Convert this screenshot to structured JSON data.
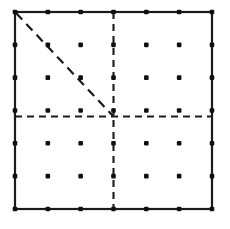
{
  "figure": {
    "canvas": {
      "width": 230,
      "height": 229,
      "background": "#ffffff"
    },
    "square": {
      "name": "outer-square",
      "x": 15,
      "y": 12,
      "size": 197,
      "stroke": "#1a1a1a",
      "stroke_width": 2.2,
      "style": "solid"
    },
    "lattice": {
      "name": "dot-lattice",
      "cells_per_side": 6,
      "points_per_side": 7,
      "spacing": 32.83,
      "origin_x": 15,
      "origin_y": 12,
      "dot_radius": 2.3,
      "dot_color": "#101010",
      "total_dots": 49
    },
    "bisectors": [
      {
        "name": "vertical-bisector",
        "orientation": "vertical",
        "x1": 113.5,
        "y1": 12,
        "x2": 113.5,
        "y2": 213,
        "style": "dashed",
        "dash": "7 5",
        "stroke": "#1a1a1a",
        "stroke_width": 2.1
      },
      {
        "name": "horizontal-bisector",
        "orientation": "horizontal",
        "x1": 15,
        "y1": 116.5,
        "x2": 212,
        "y2": 116.5,
        "style": "dashed",
        "dash": "7 5",
        "stroke": "#1a1a1a",
        "stroke_width": 2.1
      }
    ],
    "diagonal": {
      "name": "corner-to-center-diagonal",
      "from": "top-left-corner",
      "to": "center",
      "x1": 16,
      "y1": 13,
      "x2": 113.5,
      "y2": 116.5,
      "style": "dashed",
      "dash": "9 6",
      "stroke": "#1a1a1a",
      "stroke_width": 2.2
    },
    "quadrants": [
      {
        "name": "top-left-quadrant",
        "interior_dots": 9,
        "has_diagonal": true
      },
      {
        "name": "top-right-quadrant",
        "interior_dots": 9,
        "has_diagonal": false
      },
      {
        "name": "bottom-left-quadrant",
        "interior_dots": 9,
        "has_diagonal": false
      },
      {
        "name": "bottom-right-quadrant",
        "interior_dots": 9,
        "has_diagonal": false
      }
    ]
  },
  "chart_data": {
    "type": "scatter",
    "xlabel": "",
    "ylabel": "",
    "xlim": [
      0,
      6
    ],
    "ylim": [
      0,
      6
    ],
    "grid": false,
    "legend": null,
    "series": [
      {
        "name": "lattice-points",
        "marker": "dot",
        "x": [
          0,
          1,
          2,
          3,
          4,
          5,
          6,
          0,
          1,
          2,
          3,
          4,
          5,
          6,
          0,
          1,
          2,
          3,
          4,
          5,
          6,
          0,
          1,
          2,
          3,
          4,
          5,
          6,
          0,
          1,
          2,
          3,
          4,
          5,
          6,
          0,
          1,
          2,
          3,
          4,
          5,
          6,
          0,
          1,
          2,
          3,
          4,
          5,
          6
        ],
        "y": [
          6,
          6,
          6,
          6,
          6,
          6,
          6,
          5,
          5,
          5,
          5,
          5,
          5,
          5,
          4,
          4,
          4,
          4,
          4,
          4,
          4,
          3,
          3,
          3,
          3,
          3,
          3,
          3,
          2,
          2,
          2,
          2,
          2,
          2,
          2,
          1,
          1,
          1,
          1,
          1,
          1,
          1,
          0,
          0,
          0,
          0,
          0,
          0,
          0
        ]
      }
    ],
    "annotations": [
      {
        "name": "outer-square",
        "type": "rect",
        "x": 0,
        "y": 0,
        "width": 6,
        "height": 6,
        "style": "solid"
      },
      {
        "name": "vertical-bisector",
        "type": "line",
        "x": [
          3,
          3
        ],
        "y": [
          0,
          6
        ],
        "style": "dashed"
      },
      {
        "name": "horizontal-bisector",
        "type": "line",
        "x": [
          0,
          6
        ],
        "y": [
          3,
          3
        ],
        "style": "dashed"
      },
      {
        "name": "corner-to-center-diagonal",
        "type": "line",
        "x": [
          0,
          3
        ],
        "y": [
          6,
          3
        ],
        "style": "dashed"
      }
    ]
  }
}
